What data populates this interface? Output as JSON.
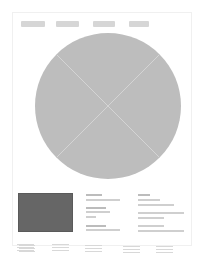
{
  "page": {
    "nav": {
      "items": [
        "nav-1",
        "nav-2",
        "nav-3",
        "nav-4"
      ],
      "color": "#d6d6d6"
    },
    "hero": {
      "shape": "circle-placeholder",
      "color": "#bdbdbd",
      "cross_lines": true
    },
    "image_block": {
      "color": "#666666"
    },
    "text_columns": 2,
    "footer_columns": 5
  }
}
